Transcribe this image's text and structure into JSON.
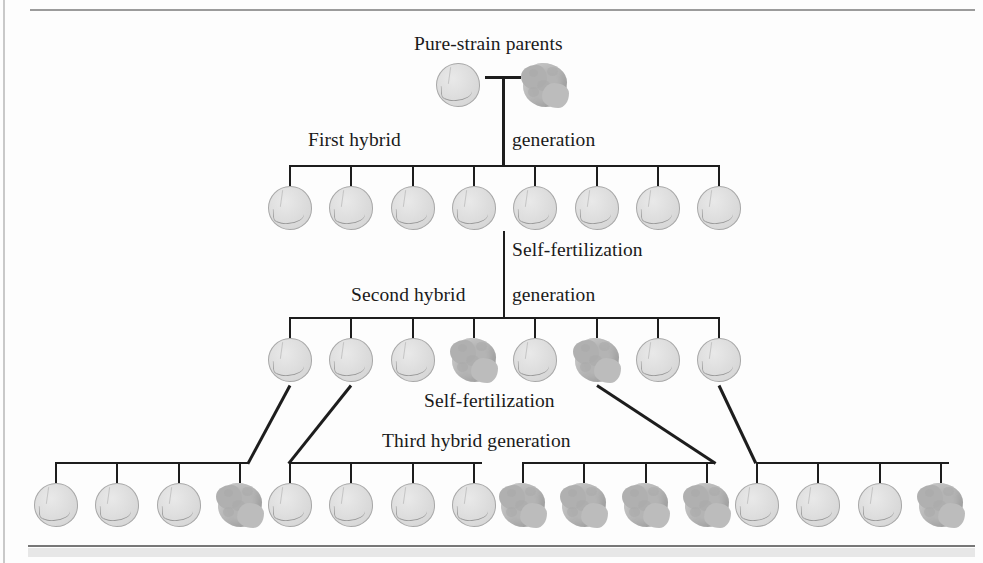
{
  "figure": {
    "type": "pedigree-diagram",
    "colors": {
      "line": "#1d1d1d",
      "round_pea_fill": "#dcdcdc",
      "round_pea_outline": "#a8a8a8",
      "wrinkled_pea_fill": "#b4b4b4",
      "frame": "#9b9b9b",
      "background": "#fdfdfd"
    }
  },
  "labels": {
    "parents": "Pure-strain parents",
    "gen1_left": "First hybrid",
    "gen1_right": "generation",
    "self_fertilization_1": "Self-fertilization",
    "gen2_left": "Second hybrid",
    "gen2_right": "generation",
    "self_fertilization_2": "Self-fertilization",
    "gen3": "Third hybrid generation"
  },
  "generations": [
    {
      "name": "Pure-strain parents",
      "cross_symbol": "T-cross",
      "peas": [
        {
          "index": 1,
          "phenotype": "round"
        },
        {
          "index": 2,
          "phenotype": "wrinkled"
        }
      ]
    },
    {
      "name": "First hybrid generation",
      "count": 8,
      "round_count": 8,
      "wrinkled_count": 0,
      "peas": [
        {
          "index": 1,
          "phenotype": "round"
        },
        {
          "index": 2,
          "phenotype": "round"
        },
        {
          "index": 3,
          "phenotype": "round"
        },
        {
          "index": 4,
          "phenotype": "round"
        },
        {
          "index": 5,
          "phenotype": "round"
        },
        {
          "index": 6,
          "phenotype": "round"
        },
        {
          "index": 7,
          "phenotype": "round"
        },
        {
          "index": 8,
          "phenotype": "round"
        }
      ]
    },
    {
      "name": "Second hybrid generation",
      "count": 8,
      "round_count": 6,
      "wrinkled_count": 2,
      "peas": [
        {
          "index": 1,
          "phenotype": "round"
        },
        {
          "index": 2,
          "phenotype": "round"
        },
        {
          "index": 3,
          "phenotype": "round"
        },
        {
          "index": 4,
          "phenotype": "wrinkled"
        },
        {
          "index": 5,
          "phenotype": "round"
        },
        {
          "index": 6,
          "phenotype": "wrinkled"
        },
        {
          "index": 7,
          "phenotype": "round"
        },
        {
          "index": 8,
          "phenotype": "round"
        }
      ]
    },
    {
      "name": "Third hybrid generation",
      "count": 16,
      "round_count": 11,
      "wrinkled_count": 5,
      "peas": [
        {
          "index": 1,
          "phenotype": "round"
        },
        {
          "index": 2,
          "phenotype": "round"
        },
        {
          "index": 3,
          "phenotype": "round"
        },
        {
          "index": 4,
          "phenotype": "wrinkled"
        },
        {
          "index": 5,
          "phenotype": "round"
        },
        {
          "index": 6,
          "phenotype": "round"
        },
        {
          "index": 7,
          "phenotype": "round"
        },
        {
          "index": 8,
          "phenotype": "round"
        },
        {
          "index": 9,
          "phenotype": "wrinkled"
        },
        {
          "index": 10,
          "phenotype": "wrinkled"
        },
        {
          "index": 11,
          "phenotype": "wrinkled"
        },
        {
          "index": 12,
          "phenotype": "wrinkled"
        },
        {
          "index": 13,
          "phenotype": "round"
        },
        {
          "index": 14,
          "phenotype": "round"
        },
        {
          "index": 15,
          "phenotype": "round"
        },
        {
          "index": 16,
          "phenotype": "wrinkled"
        }
      ]
    }
  ]
}
